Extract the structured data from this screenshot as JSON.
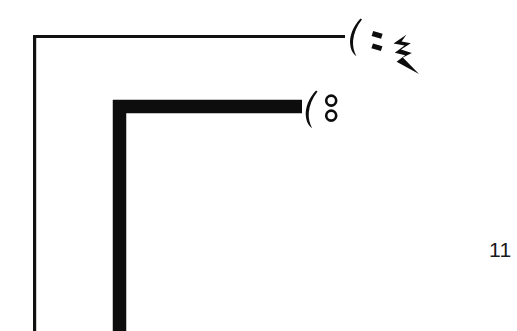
{
  "page": {
    "background_color": "#ffffff",
    "ink_color": "#0d0d0d",
    "width": 517,
    "height": 331
  },
  "figure": {
    "caption": "",
    "page_number": "11",
    "outer_corner": {
      "name": "thin-corner-line",
      "stroke_color": "#111111",
      "stroke_width": 3,
      "horizontal_from_x": 33,
      "horizontal_to_x": 345,
      "horizontal_y": 36,
      "vertical_x": 34,
      "vertical_from_y": 36,
      "vertical_to_y": 331
    },
    "inner_corner": {
      "name": "thick-corner-line",
      "stroke_color": "#0d0d0d",
      "stroke_width": 13,
      "horizontal_from_x": 113,
      "horizontal_to_x": 302,
      "horizontal_y": 106,
      "vertical_x": 119,
      "vertical_from_y": 100,
      "vertical_to_y": 331
    }
  },
  "annotations": [
    {
      "id": "annotation-upper",
      "name": "paren-colon-bolt-mark",
      "description": "open parenthesis followed by slanted colon strokes and a lightning-bolt zigzag",
      "glyph_text": "(:",
      "parts": [
        "open-paren",
        "colon-upper-dash",
        "colon-lower-dash",
        "lightning-bolt"
      ],
      "x": 348,
      "y": 16
    },
    {
      "id": "annotation-lower",
      "name": "paren-double-circle-mark",
      "description": "open parenthesis followed by two small open circles stacked vertically",
      "glyph_text": "(o o",
      "parts": [
        "open-paren",
        "circle-upper",
        "circle-lower"
      ],
      "x": 303,
      "y": 88
    }
  ]
}
